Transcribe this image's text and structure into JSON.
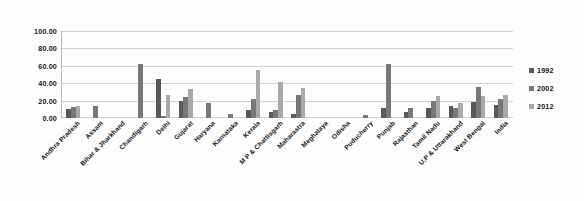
{
  "chart_data": {
    "type": "bar",
    "title": "",
    "subtitle": "",
    "xlabel": "",
    "ylabel": "",
    "ylim": [
      0,
      100
    ],
    "ytick_labels": [
      "100.00",
      "80.00",
      "60.00",
      "40.00",
      "20.00",
      "0.00"
    ],
    "ytick_values": [
      100,
      80,
      60,
      40,
      20,
      0
    ],
    "grid": true,
    "legend_position": "right",
    "categories": [
      "Andhra Pradesh",
      "Assam",
      "Bihar & Jharkhand",
      "Chandigarh",
      "Delhi",
      "Gujarat",
      "Haryana",
      "Karnataka",
      "Kerala",
      "M P & Chattisgarh",
      "Maharastra",
      "Meghalaya",
      "Odisha",
      "Puducherry",
      "Punjab",
      "Rajasthan",
      "Tamil Nadu",
      "U.P & Uttarakhand",
      "West Bengal",
      "India"
    ],
    "series": [
      {
        "name": "1992",
        "color": "#595959",
        "values": [
          10.0,
          0.0,
          0.0,
          0.0,
          45.0,
          20.0,
          0.0,
          0.0,
          9.0,
          7.0,
          5.0,
          0.0,
          0.0,
          0.0,
          11.0,
          7.0,
          11.0,
          14.0,
          18.0,
          15.0
        ]
      },
      {
        "name": "2002",
        "color": "#787878",
        "values": [
          13.0,
          14.0,
          0.0,
          62.0,
          2.0,
          24.0,
          17.0,
          5.0,
          22.0,
          9.0,
          27.0,
          0.0,
          0.0,
          4.0,
          62.0,
          11.0,
          19.0,
          11.0,
          36.0,
          22.0
        ]
      },
      {
        "name": "2012",
        "color": "#a9a9a9",
        "values": [
          14.0,
          0.0,
          0.0,
          0.0,
          27.0,
          33.0,
          0.0,
          0.0,
          55.0,
          41.0,
          35.0,
          0.0,
          0.0,
          0.0,
          0.0,
          0.0,
          25.0,
          17.0,
          25.0,
          27.0
        ]
      }
    ]
  },
  "legend": {
    "items": [
      {
        "label": "1992",
        "color": "#595959"
      },
      {
        "label": "2002",
        "color": "#787878"
      },
      {
        "label": "2012",
        "color": "#a9a9a9"
      }
    ]
  }
}
